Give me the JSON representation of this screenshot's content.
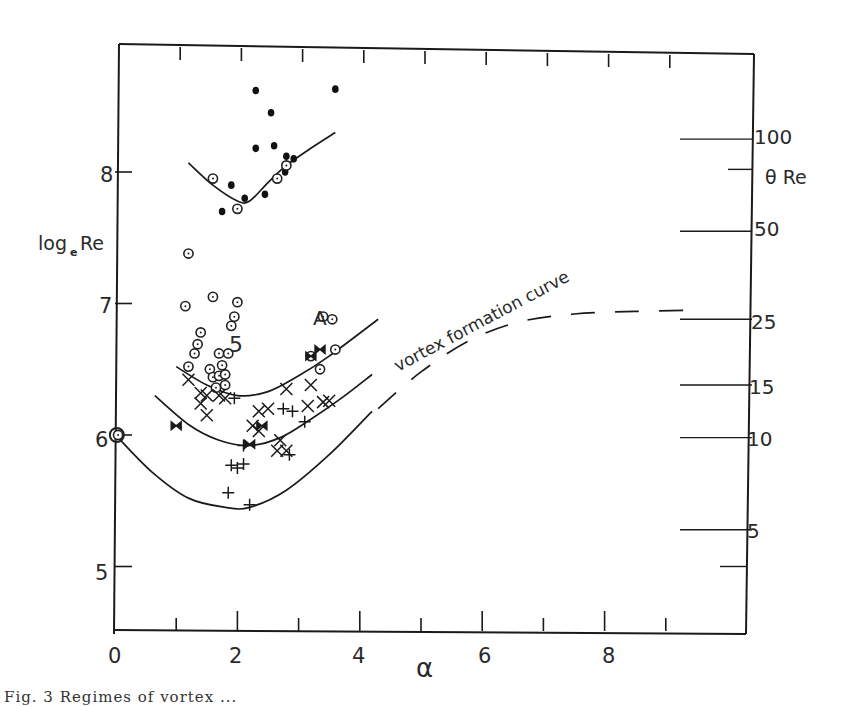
{
  "chart_data": {
    "type": "scatter",
    "title": "",
    "xlabel": "α",
    "ylabel": "log_e Re",
    "ylabel_right": "θ Re",
    "xlim": [
      0,
      10
    ],
    "ylim": [
      4.5,
      8.95
    ],
    "x_ticks": [
      0,
      2,
      4,
      6,
      8
    ],
    "x_minor_ticks": [
      1,
      3,
      5,
      7,
      9
    ],
    "y_ticks": [
      5,
      6,
      7,
      8
    ],
    "right_axis_ticks": [
      {
        "label": "100",
        "logRe": 8.25
      },
      {
        "label": "50",
        "logRe": 7.55
      },
      {
        "label": "25",
        "logRe": 6.88
      },
      {
        "label": "15",
        "logRe": 6.38
      },
      {
        "label": "10",
        "logRe": 5.98
      },
      {
        "label": "5",
        "logRe": 5.28
      }
    ],
    "grid": false,
    "annotations": [
      {
        "text": "vortex formation curve",
        "x": 5.0,
        "y": 6.55,
        "rotation": -28
      },
      {
        "text": "A",
        "x": 3.1,
        "y": 6.88
      },
      {
        "text": "5",
        "x": 2.0,
        "y": 6.62
      }
    ],
    "curves": [
      {
        "name": "upper curve (high Re)",
        "style": "solid",
        "points": [
          [
            1.2,
            8.07
          ],
          [
            1.6,
            7.9
          ],
          [
            2.0,
            7.78
          ],
          [
            2.2,
            7.78
          ],
          [
            2.5,
            7.92
          ],
          [
            2.8,
            8.05
          ],
          [
            3.2,
            8.18
          ],
          [
            3.6,
            8.3
          ]
        ]
      },
      {
        "name": "vortex formation curve (upper)",
        "style": "solid",
        "points": [
          [
            1.0,
            6.52
          ],
          [
            1.5,
            6.38
          ],
          [
            2.0,
            6.3
          ],
          [
            2.5,
            6.33
          ],
          [
            3.0,
            6.45
          ],
          [
            3.5,
            6.6
          ],
          [
            4.3,
            6.88
          ]
        ]
      },
      {
        "name": "middle curve",
        "style": "solid",
        "points": [
          [
            0.65,
            6.3
          ],
          [
            1.2,
            6.08
          ],
          [
            1.7,
            5.96
          ],
          [
            2.2,
            5.92
          ],
          [
            2.7,
            5.98
          ],
          [
            3.2,
            6.12
          ],
          [
            3.7,
            6.28
          ],
          [
            4.2,
            6.46
          ]
        ]
      },
      {
        "name": "lower curve",
        "style": "solid",
        "points": [
          [
            0.05,
            5.98
          ],
          [
            0.6,
            5.72
          ],
          [
            1.2,
            5.52
          ],
          [
            1.8,
            5.45
          ],
          [
            2.2,
            5.45
          ],
          [
            2.8,
            5.58
          ],
          [
            3.5,
            5.85
          ],
          [
            4.2,
            6.18
          ]
        ]
      },
      {
        "name": "extrapolated curve",
        "style": "dashed",
        "points": [
          [
            4.3,
            6.2
          ],
          [
            5.0,
            6.48
          ],
          [
            5.8,
            6.72
          ],
          [
            6.6,
            6.86
          ],
          [
            7.5,
            6.92
          ],
          [
            8.5,
            6.94
          ],
          [
            9.5,
            6.95
          ]
        ]
      }
    ],
    "series": [
      {
        "name": "filled dots",
        "marker": "filled-circle",
        "points": [
          [
            2.3,
            8.62
          ],
          [
            2.55,
            8.45
          ],
          [
            3.6,
            8.63
          ],
          [
            2.6,
            8.2
          ],
          [
            2.3,
            8.18
          ],
          [
            1.9,
            7.9
          ],
          [
            2.45,
            7.83
          ],
          [
            2.8,
            8.12
          ],
          [
            2.92,
            8.1
          ],
          [
            2.78,
            8.0
          ],
          [
            1.75,
            7.7
          ],
          [
            2.12,
            7.8
          ]
        ]
      },
      {
        "name": "circled dots",
        "marker": "dotted-circle",
        "points": [
          [
            1.6,
            7.95
          ],
          [
            2.0,
            7.72
          ],
          [
            2.8,
            8.05
          ],
          [
            2.65,
            7.95
          ],
          [
            1.2,
            7.38
          ],
          [
            1.15,
            6.98
          ],
          [
            1.6,
            7.05
          ],
          [
            2.0,
            7.01
          ],
          [
            1.95,
            6.9
          ],
          [
            1.9,
            6.83
          ],
          [
            1.4,
            6.78
          ],
          [
            1.35,
            6.69
          ],
          [
            1.3,
            6.62
          ],
          [
            1.2,
            6.52
          ],
          [
            1.7,
            6.62
          ],
          [
            1.85,
            6.62
          ],
          [
            1.75,
            6.53
          ],
          [
            1.55,
            6.5
          ],
          [
            1.6,
            6.44
          ],
          [
            1.7,
            6.45
          ],
          [
            1.8,
            6.46
          ],
          [
            1.65,
            6.36
          ],
          [
            1.8,
            6.38
          ],
          [
            3.6,
            6.65
          ],
          [
            3.4,
            6.9
          ],
          [
            3.55,
            6.88
          ],
          [
            3.2,
            6.6
          ],
          [
            3.35,
            6.5
          ],
          [
            0.05,
            6.0
          ]
        ]
      },
      {
        "name": "crosses (x)",
        "marker": "x",
        "points": [
          [
            1.2,
            6.42
          ],
          [
            1.4,
            6.32
          ],
          [
            1.4,
            6.24
          ],
          [
            1.5,
            6.15
          ],
          [
            1.7,
            6.3
          ],
          [
            1.8,
            6.28
          ],
          [
            2.35,
            6.18
          ],
          [
            2.5,
            6.2
          ],
          [
            2.25,
            6.07
          ],
          [
            2.35,
            6.03
          ],
          [
            2.8,
            6.35
          ],
          [
            3.2,
            6.38
          ],
          [
            3.15,
            6.22
          ],
          [
            3.4,
            6.25
          ],
          [
            2.7,
            5.96
          ],
          [
            2.8,
            5.88
          ],
          [
            2.65,
            5.88
          ],
          [
            3.5,
            6.26
          ],
          [
            1.5,
            6.3
          ]
        ]
      },
      {
        "name": "plus signs",
        "marker": "plus",
        "points": [
          [
            1.9,
            5.77
          ],
          [
            2.0,
            5.75
          ],
          [
            2.1,
            5.78
          ],
          [
            1.85,
            5.56
          ],
          [
            2.2,
            5.47
          ],
          [
            2.1,
            5.92
          ],
          [
            2.85,
            5.85
          ],
          [
            3.1,
            6.1
          ],
          [
            2.75,
            6.2
          ],
          [
            2.9,
            6.18
          ],
          [
            1.95,
            6.28
          ]
        ]
      },
      {
        "name": "bow-tie markers",
        "marker": "bowtie",
        "points": [
          [
            1.0,
            6.07
          ],
          [
            2.2,
            5.93
          ],
          [
            2.4,
            6.07
          ],
          [
            3.2,
            6.6
          ],
          [
            3.35,
            6.65
          ]
        ]
      }
    ]
  },
  "figure": {
    "y_tick_labels": [
      "5",
      "6",
      "7",
      "8"
    ],
    "x_tick_labels": [
      "0",
      "2",
      "4",
      "6",
      "8"
    ],
    "right_tick_labels": [
      "100",
      "50",
      "25",
      "15",
      "10",
      "5"
    ],
    "ylabel_left_main": "log",
    "ylabel_left_sub": "e",
    "ylabel_left_tail": "Re",
    "ylabel_right": "θ Re",
    "xlabel": "α",
    "annotation_vortex": "vortex formation curve",
    "annotation_A": "A",
    "annotation_5": "5",
    "caption": "Fig. 3    Regimes of vortex ..."
  }
}
